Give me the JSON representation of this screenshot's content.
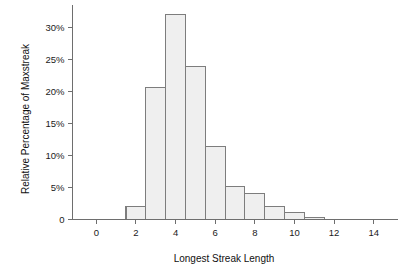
{
  "chart_data": {
    "type": "bar",
    "title": "",
    "subtitle": "",
    "xlabel": "Longest Streak Length",
    "ylabel": "Relative Percentage of Maxstreak",
    "categories": [
      2,
      3,
      4,
      5,
      6,
      7,
      8,
      9,
      10,
      11
    ],
    "values": [
      2.0,
      20.6,
      32.1,
      23.9,
      11.4,
      5.1,
      4.1,
      2.1,
      1.1,
      0.3
    ],
    "bar_width": 1,
    "bar_edges": [
      [
        1.5,
        2.5
      ],
      [
        2.5,
        3.5
      ],
      [
        3.5,
        4.5
      ],
      [
        4.5,
        5.5
      ],
      [
        5.5,
        6.5
      ],
      [
        6.5,
        7.5
      ],
      [
        7.5,
        8.5
      ],
      [
        8.5,
        9.5
      ],
      [
        9.5,
        10.5
      ],
      [
        10.5,
        11.5
      ]
    ],
    "xlim": [
      -1.2,
      15.2
    ],
    "ylim": [
      0,
      33.5
    ],
    "xticks": [
      0,
      2,
      4,
      6,
      8,
      10,
      12,
      14
    ],
    "xtick_labels": [
      "0",
      "2",
      "4",
      "6",
      "8",
      "10",
      "12",
      "14"
    ],
    "yticks": [
      0,
      5,
      10,
      15,
      20,
      25,
      30
    ],
    "ytick_labels": [
      "0",
      "5%",
      "10%",
      "15%",
      "20%",
      "25%",
      "30%"
    ],
    "grid": false,
    "legend": null,
    "legend_position": "none",
    "annotations": [],
    "colors": {
      "bar_fill": "#efefef",
      "bar_stroke": "#7d7d7d",
      "axis": "#6e6e6e",
      "text": "#1a1a1a",
      "background": "#ffffff"
    }
  }
}
